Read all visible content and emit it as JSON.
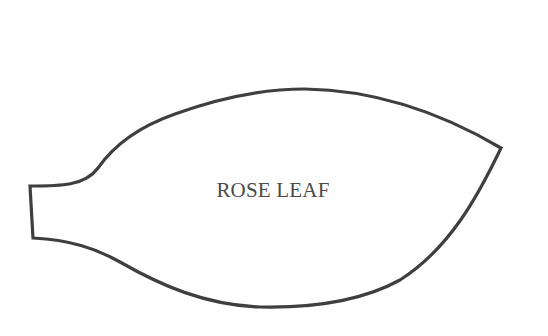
{
  "diagram": {
    "title": "ROSE LEAF",
    "stroke_color": "#3f3f3f",
    "text_color": "#4a4a4a",
    "background": "#ffffff"
  }
}
